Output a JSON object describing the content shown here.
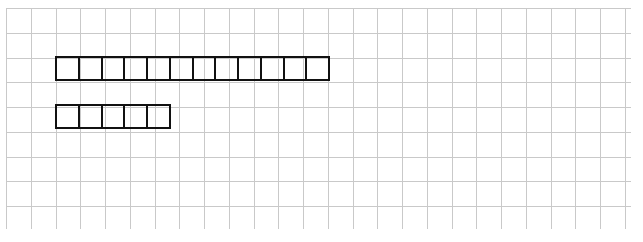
{
  "figure": {
    "type": "tape-diagram",
    "title": "",
    "background_color": "#ffffff",
    "grid": {
      "label": "grid paper background",
      "line_color": "#c9c9c9",
      "line_width_px": 1,
      "cell_size_px": 24.75,
      "columns": 25,
      "rows": 9,
      "origin_x_px": 6,
      "origin_y_px": 8,
      "width_px": 625,
      "height_px": 221
    },
    "bars": [
      {
        "name": "top-bar",
        "units": 12,
        "unit_labels": [
          "",
          "",
          "",
          "",
          "",
          "",
          "",
          "",
          "",
          "",
          "",
          ""
        ],
        "start_x_px": 55,
        "start_y_px": 56,
        "cell_width_px": 24.75,
        "cell_height_px": 24.75,
        "border_color": "#111111",
        "border_width_px": 2,
        "fill_color": "transparent"
      },
      {
        "name": "bottom-bar",
        "units": 5,
        "unit_labels": [
          "",
          "",
          "",
          "",
          ""
        ],
        "start_x_px": 55,
        "start_y_px": 104,
        "cell_width_px": 24.75,
        "cell_height_px": 24.75,
        "border_color": "#111111",
        "border_width_px": 2,
        "fill_color": "transparent"
      }
    ]
  }
}
